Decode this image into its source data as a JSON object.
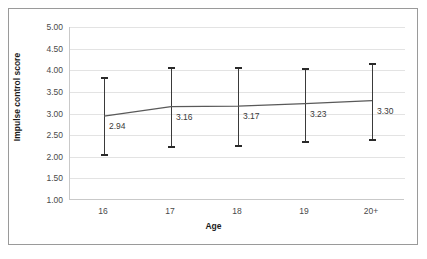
{
  "chart_data": {
    "type": "line",
    "title": "",
    "xlabel": "Age",
    "ylabel": "Impulse control score",
    "categories": [
      "16",
      "17",
      "18",
      "19",
      "20+"
    ],
    "values": [
      2.94,
      3.16,
      3.17,
      3.23,
      3.3
    ],
    "value_labels": [
      "2.94",
      "3.16",
      "3.17",
      "3.23",
      "3.30"
    ],
    "error_bars": [
      {
        "category": "16",
        "lower": 2.05,
        "upper": 3.83
      },
      {
        "category": "17",
        "lower": 2.23,
        "upper": 4.06
      },
      {
        "category": "18",
        "lower": 2.25,
        "upper": 4.05
      },
      {
        "category": "19",
        "lower": 2.33,
        "upper": 4.03
      },
      {
        "category": "20+",
        "lower": 2.38,
        "upper": 4.15
      }
    ],
    "ylim": [
      1.0,
      5.0
    ],
    "ytick_step": 0.5,
    "ytick_labels": [
      "5.00",
      "4.50",
      "4.00",
      "3.50",
      "3.00",
      "2.50",
      "2.00",
      "1.50",
      "1.00"
    ],
    "ytick_values": [
      5.0,
      4.5,
      4.0,
      3.5,
      3.0,
      2.5,
      2.0,
      1.5,
      1.0
    ],
    "grid": true,
    "legend": "none",
    "series_color": "#595959",
    "errorbar_color": "#3a3a3a",
    "grid_color": "#e3e3e3",
    "frame_color": "#9a9a9a"
  }
}
